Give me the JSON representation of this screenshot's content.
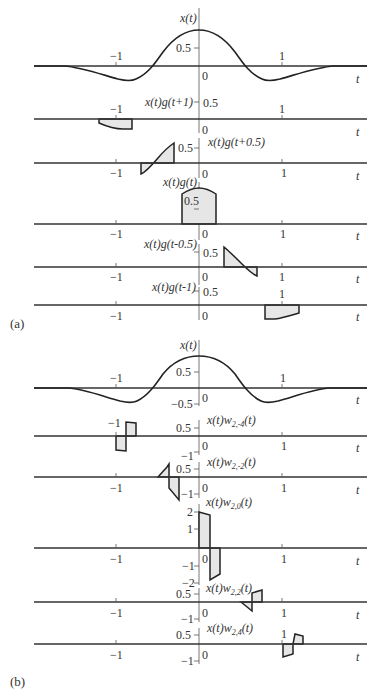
{
  "figure": {
    "panel_a": {
      "label": "(a)",
      "plots": [
        {
          "id": "x",
          "title": "x(t)",
          "y_ticks": [
            "0.5"
          ],
          "x_ticks": [
            "−1",
            "0",
            "1"
          ],
          "x_axis_label": "t"
        },
        {
          "id": "xg_p1",
          "title": "x(t)g(t+1)",
          "y_ticks": [
            "0.5"
          ],
          "x_ticks": [
            "−1",
            "0",
            "1"
          ],
          "x_axis_label": "t"
        },
        {
          "id": "xg_p05",
          "title": "x(t)g(t+0.5)",
          "y_ticks": [
            "0.5"
          ],
          "x_ticks": [
            "−1",
            "0",
            "1"
          ],
          "x_axis_label": "t"
        },
        {
          "id": "xg_0",
          "title": "x(t)g(t)",
          "y_ticks": [
            "0.5"
          ],
          "x_ticks": [
            "−1",
            "0",
            "1"
          ],
          "x_axis_label": "t"
        },
        {
          "id": "xg_m05",
          "title": "x(t)g(t-0.5)",
          "y_ticks": [
            "0.5"
          ],
          "x_ticks": [
            "−1",
            "0",
            "1"
          ],
          "x_axis_label": "t"
        },
        {
          "id": "xg_m1",
          "title": "x(t)g(t-1)",
          "y_ticks": [
            "0.5"
          ],
          "x_ticks": [
            "−1",
            "0",
            "1"
          ],
          "extra_label": "1",
          "x_axis_label": "t"
        }
      ]
    },
    "panel_b": {
      "label": "(b)",
      "plots": [
        {
          "id": "x",
          "title": "x(t)",
          "y_ticks": [
            "0.5",
            "−0.5"
          ],
          "x_ticks": [
            "−1",
            "0",
            "1"
          ],
          "x_axis_label": "t"
        },
        {
          "id": "w_m4",
          "title_base": "x(t)w",
          "title_sub": "2,-4",
          "title_tail": "(t)",
          "y_ticks": [
            "0.5",
            "−1"
          ],
          "x_ticks": [
            "−1",
            "0",
            "1"
          ],
          "x_axis_label": "t"
        },
        {
          "id": "w_m2",
          "title_base": "x(t)w",
          "title_sub": "2,-2",
          "title_tail": "(t)",
          "y_ticks": [
            "0.5",
            "−1"
          ],
          "x_ticks": [
            "−1",
            "0",
            "1"
          ],
          "x_axis_label": "t"
        },
        {
          "id": "w_0",
          "title_base": "x(t)w",
          "title_sub": "2,0",
          "title_tail": "(t)",
          "y_ticks": [
            "2",
            "1",
            "−1",
            "−2"
          ],
          "x_ticks": [
            "−1",
            "0",
            "1"
          ],
          "x_axis_label": "t"
        },
        {
          "id": "w_2",
          "title_base": "x(t)w",
          "title_sub": "2,2",
          "title_tail": "(t)",
          "y_ticks": [
            "0.5",
            "−1"
          ],
          "x_ticks": [
            "−1",
            "0",
            "1"
          ],
          "x_axis_label": "t"
        },
        {
          "id": "w_4",
          "title_base": "x(t)w",
          "title_sub": "2,4",
          "title_tail": "(t)",
          "y_ticks": [
            "0.5",
            "−1"
          ],
          "x_ticks": [
            "−1",
            "0",
            "1"
          ],
          "x_axis_label": "t"
        }
      ]
    }
  },
  "colors": {
    "line": "#222222",
    "fill": "#e6e6e6",
    "text": "#333333"
  }
}
